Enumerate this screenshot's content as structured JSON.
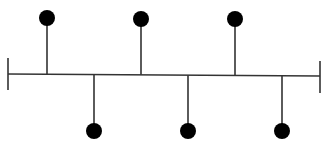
{
  "diagram": {
    "type": "timeline-stem-diagram",
    "stroke_color": "#333333",
    "dot_color": "#000000",
    "background": "#ffffff",
    "axis": {
      "x1": 8,
      "y1": 74,
      "x2": 320,
      "y2": 76
    },
    "left_cap": {
      "x": 8,
      "y1": 58,
      "y2": 90
    },
    "right_cap": {
      "x": 320,
      "y1": 61,
      "y2": 93
    },
    "top_markers": [
      {
        "x": 47,
        "dot_y": 18
      },
      {
        "x": 141,
        "dot_y": 19
      },
      {
        "x": 235,
        "dot_y": 19
      }
    ],
    "bottom_markers": [
      {
        "x": 94,
        "dot_y": 131
      },
      {
        "x": 188,
        "dot_y": 131
      },
      {
        "x": 282,
        "dot_y": 131
      }
    ],
    "dot_radius": 8
  }
}
